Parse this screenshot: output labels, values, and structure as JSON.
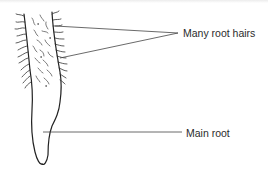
{
  "diagram": {
    "labels": {
      "root_hairs": "Many root hairs",
      "main_root": "Main root"
    },
    "colors": {
      "ink": "#2b2b2b",
      "leader_line": "#444444",
      "background": "#ffffff"
    }
  }
}
